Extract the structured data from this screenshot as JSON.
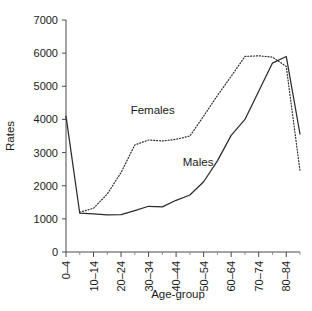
{
  "chart_data": {
    "type": "line",
    "title": "",
    "xlabel": "Age-group",
    "ylabel": "Rates",
    "categories": [
      "0-4",
      "5-9",
      "10-14",
      "15-19",
      "20-24",
      "25-29",
      "30-34",
      "35-39",
      "40-44",
      "45-49",
      "50-54",
      "55-59",
      "60-64",
      "65-69",
      "70-74",
      "75-79",
      "80-84",
      "85+"
    ],
    "xtick_labels": [
      "0–4",
      "10–14",
      "20–24",
      "30–34",
      "40–44",
      "50–54",
      "60–64",
      "70–74",
      "80–84"
    ],
    "ytick_labels": [
      "0",
      "1000",
      "2000",
      "3000",
      "4000",
      "5000",
      "6000",
      "7000"
    ],
    "ylim": [
      0,
      7000
    ],
    "yticks": [
      0,
      1000,
      2000,
      3000,
      4000,
      5000,
      6000,
      7000
    ],
    "grid": false,
    "legend_position": "inline-annotation",
    "series": [
      {
        "name": "Males",
        "style": "solid",
        "label_text": "Males",
        "values": [
          4100,
          1170,
          1150,
          1120,
          1130,
          1250,
          1380,
          1360,
          1560,
          1720,
          2120,
          2750,
          3520,
          4000,
          4850,
          5700,
          5900,
          3560
        ]
      },
      {
        "name": "Females",
        "style": "dotted",
        "label_text": "Females",
        "values": [
          null,
          1200,
          1320,
          1750,
          2400,
          3230,
          3380,
          3350,
          3400,
          3500,
          4100,
          4720,
          5300,
          5900,
          5920,
          5880,
          5600,
          2450
        ]
      }
    ],
    "annotations": [
      {
        "text": "Females",
        "x_index": 6.3,
        "y_value": 4150
      },
      {
        "text": "Males",
        "x_index": 9.6,
        "y_value": 2590
      }
    ]
  }
}
